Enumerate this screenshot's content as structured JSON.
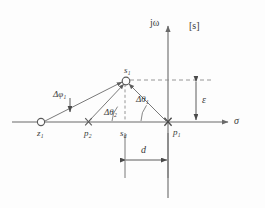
{
  "figure": {
    "name": "root-locus-pole-zero-geometry",
    "colors": {
      "line": "#6a6a6a",
      "text": "#3a3a3a",
      "dashed": "#8a8a8a",
      "background": "#fdfdfd"
    },
    "axes": {
      "imaginary_label": "jω",
      "real_label": "σ",
      "plane_label": "[s]"
    },
    "points": [
      {
        "id": "zero-1",
        "label": "z",
        "sub": "1",
        "marker": "open-circle"
      },
      {
        "id": "pole-2",
        "label": "p",
        "sub": "2",
        "marker": "cross"
      },
      {
        "id": "sigma-d",
        "label": "s",
        "sub": "d",
        "marker": "none"
      },
      {
        "id": "pole-1",
        "label": "p",
        "sub": "1",
        "marker": "cross"
      },
      {
        "id": "s-1",
        "label": "s",
        "sub": "1",
        "marker": "open-circle"
      }
    ],
    "angles": [
      {
        "id": "delta-phi-1",
        "label": "Δφ",
        "sub": "1"
      },
      {
        "id": "delta-theta-2",
        "label": "Δθ",
        "sub": "2"
      },
      {
        "id": "delta-theta-1",
        "label": "Δθ",
        "sub": "1"
      }
    ],
    "dimensions": [
      {
        "id": "epsilon",
        "label": "ε",
        "orientation": "vertical"
      },
      {
        "id": "d",
        "label": "d",
        "orientation": "horizontal"
      }
    ]
  }
}
